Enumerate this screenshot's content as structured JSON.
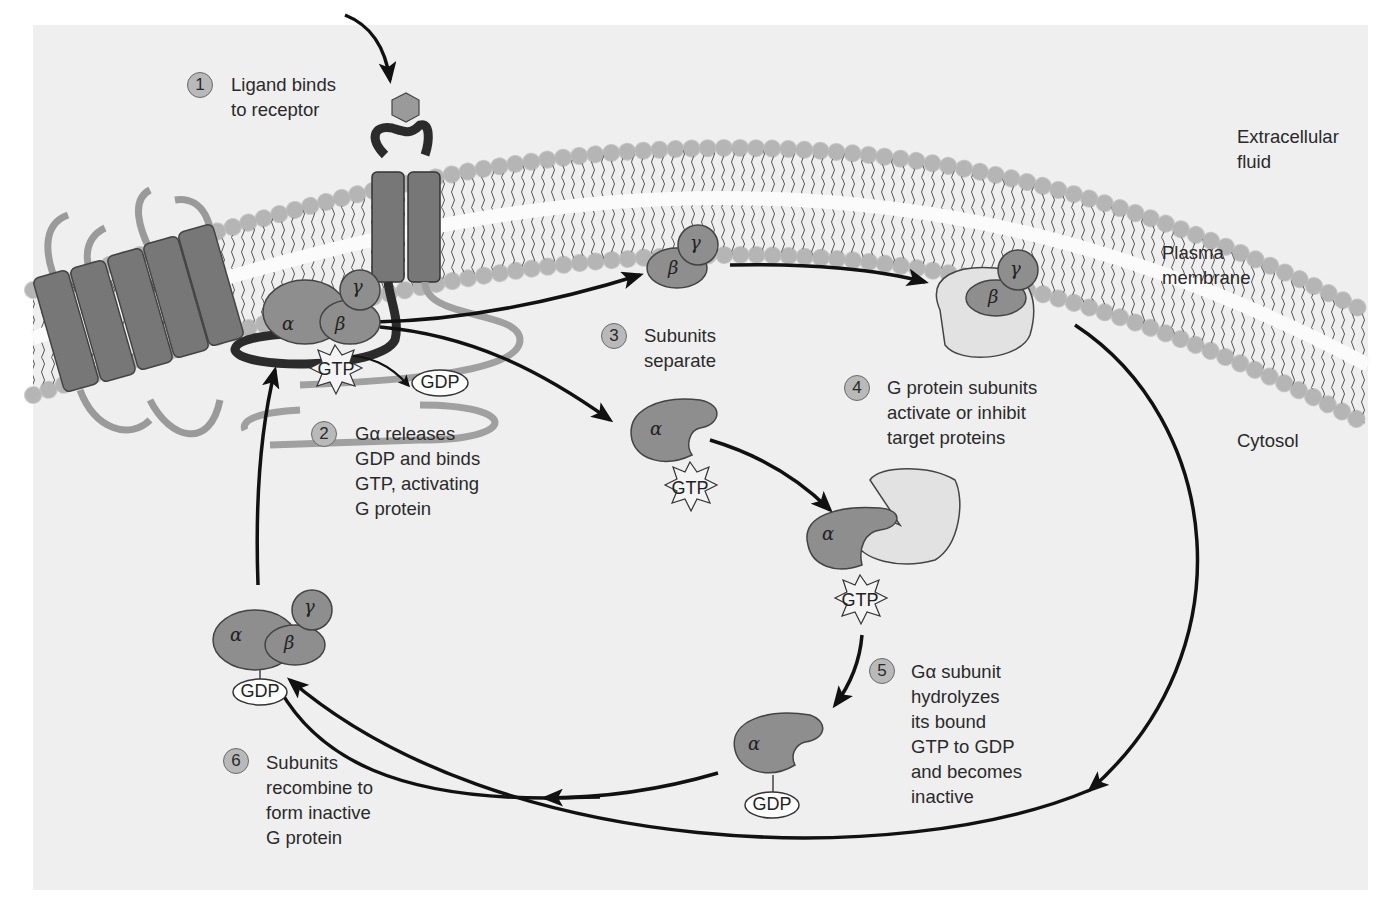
{
  "diagram": {
    "regions": {
      "extracellular": [
        "Extracellular",
        "fluid"
      ],
      "membrane": [
        "Plasma",
        "membrane"
      ],
      "cytosol": "Cytosol"
    },
    "steps": [
      {
        "num": "1",
        "lines": [
          "Ligand binds",
          "to receptor"
        ]
      },
      {
        "num": "2",
        "lines": [
          "Gα releases",
          "GDP and binds",
          "GTP, activating",
          "G protein"
        ]
      },
      {
        "num": "3",
        "lines": [
          "Subunits",
          "separate"
        ]
      },
      {
        "num": "4",
        "lines": [
          "G protein subunits",
          "activate or inhibit",
          "target proteins"
        ]
      },
      {
        "num": "5",
        "lines": [
          "Gα subunit",
          "hydrolyzes",
          "its bound",
          "GTP to GDP",
          "and becomes",
          "inactive"
        ]
      },
      {
        "num": "6",
        "lines": [
          "Subunits",
          "recombine to",
          "form inactive",
          "G protein"
        ]
      }
    ],
    "subunits": {
      "alpha": "α",
      "beta": "β",
      "gamma": "γ"
    },
    "nucleotides": {
      "gtp": "GTP",
      "gdp": "GDP"
    },
    "colors": {
      "background": "#efefef",
      "protein_dark": "#8e8e8e",
      "protein_light": "#e2e2e2",
      "lipid_head": "#d6d6d6",
      "arrow": "#111111",
      "receptor_dark": "#2b2b2b"
    }
  }
}
